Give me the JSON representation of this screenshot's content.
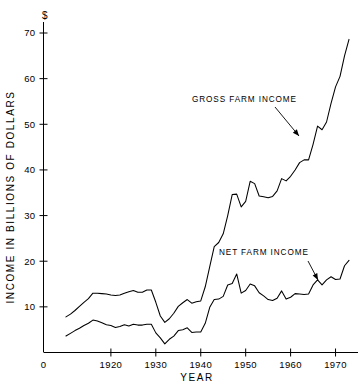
{
  "chart_data": {
    "type": "line",
    "title": "",
    "xlabel": "YEAR",
    "ylabel": "INCOME IN BILLIONS OF DOLLARS",
    "unit_symbol": "$",
    "xlim": [
      1905,
      1975
    ],
    "ylim": [
      0,
      73
    ],
    "grid": false,
    "legend_position": "inline-annotations",
    "x_tick_labels": [
      "0",
      "1920",
      "1930",
      "1940",
      "1950",
      "1960",
      "1970"
    ],
    "x_tick_values": [
      1907.5,
      1920,
      1930,
      1940,
      1950,
      1960,
      1970
    ],
    "y_tick_labels": [
      "10",
      "20",
      "30",
      "40",
      "50",
      "60",
      "70"
    ],
    "y_tick_values": [
      10,
      20,
      30,
      40,
      50,
      60,
      70
    ],
    "annotations": [
      {
        "text": "GROSS FARM INCOME",
        "text_x": 192,
        "text_y": 102,
        "arrow_from_x": 275,
        "arrow_from_y": 107,
        "arrow_to_x": 299,
        "arrow_to_y": 136
      },
      {
        "text": "NET FARM INCOME",
        "text_x": 219,
        "text_y": 255,
        "arrow_from_x": 308,
        "arrow_from_y": 261,
        "arrow_to_x": 318,
        "arrow_to_y": 280
      }
    ],
    "series": [
      {
        "name": "GROSS FARM INCOME",
        "x": [
          1910,
          1911,
          1912,
          1913,
          1914,
          1915,
          1916,
          1917,
          1918,
          1919,
          1920,
          1921,
          1922,
          1923,
          1924,
          1925,
          1926,
          1927,
          1928,
          1929,
          1930,
          1931,
          1932,
          1933,
          1934,
          1935,
          1936,
          1937,
          1938,
          1939,
          1940,
          1941,
          1942,
          1943,
          1944,
          1945,
          1946,
          1947,
          1948,
          1949,
          1950,
          1951,
          1952,
          1953,
          1954,
          1955,
          1956,
          1957,
          1958,
          1959,
          1960,
          1961,
          1962,
          1963,
          1964,
          1965,
          1966,
          1967,
          1968,
          1969,
          1970,
          1971,
          1972,
          1973
        ],
        "values": [
          7.8,
          8.4,
          9.2,
          10.1,
          11.0,
          11.8,
          13.0,
          13.0,
          12.9,
          12.8,
          12.6,
          12.5,
          12.6,
          13.0,
          13.3,
          13.6,
          13.2,
          13.2,
          13.7,
          13.7,
          11.0,
          8.0,
          6.6,
          7.4,
          8.6,
          10.1,
          10.9,
          11.6,
          10.8,
          11.1,
          11.3,
          14.4,
          18.8,
          23.2,
          24.1,
          26.0,
          30.0,
          34.6,
          34.7,
          31.9,
          33.1,
          37.5,
          37.0,
          34.3,
          34.1,
          33.9,
          34.2,
          35.4,
          38.1,
          37.6,
          38.6,
          40.0,
          41.6,
          42.2,
          42.2,
          45.6,
          49.6,
          48.8,
          50.5,
          54.6,
          58.2,
          60.5,
          65.0,
          68.6
        ]
      },
      {
        "name": "NET FARM INCOME",
        "x": [
          1910,
          1911,
          1912,
          1913,
          1914,
          1915,
          1916,
          1917,
          1918,
          1919,
          1920,
          1921,
          1922,
          1923,
          1924,
          1925,
          1926,
          1927,
          1928,
          1929,
          1930,
          1931,
          1932,
          1933,
          1934,
          1935,
          1936,
          1937,
          1938,
          1939,
          1940,
          1941,
          1942,
          1943,
          1944,
          1945,
          1946,
          1947,
          1948,
          1949,
          1950,
          1951,
          1952,
          1953,
          1954,
          1955,
          1956,
          1957,
          1958,
          1959,
          1960,
          1961,
          1962,
          1963,
          1964,
          1965,
          1966,
          1967,
          1968,
          1969,
          1970,
          1971,
          1972,
          1973
        ],
        "values": [
          3.6,
          4.2,
          4.8,
          5.3,
          5.9,
          6.4,
          7.1,
          6.9,
          6.5,
          6.1,
          5.9,
          5.5,
          5.7,
          6.1,
          5.8,
          6.2,
          6.0,
          6.0,
          6.2,
          6.2,
          4.3,
          3.2,
          1.9,
          2.9,
          3.6,
          4.8,
          5.0,
          5.4,
          4.4,
          4.5,
          4.5,
          6.4,
          9.9,
          11.6,
          11.7,
          12.3,
          14.8,
          15.1,
          17.2,
          13.0,
          13.6,
          15.0,
          14.6,
          13.1,
          12.4,
          11.6,
          11.4,
          11.9,
          13.5,
          11.7,
          12.1,
          12.9,
          12.8,
          12.7,
          12.8,
          14.8,
          15.9,
          14.8,
          15.9,
          16.6,
          16.0,
          16.1,
          19.0,
          20.2
        ]
      }
    ]
  },
  "labels": {
    "y_axis_title": "INCOME IN BILLIONS OF DOLLARS",
    "x_axis_title": "YEAR",
    "currency_marker": "$"
  }
}
